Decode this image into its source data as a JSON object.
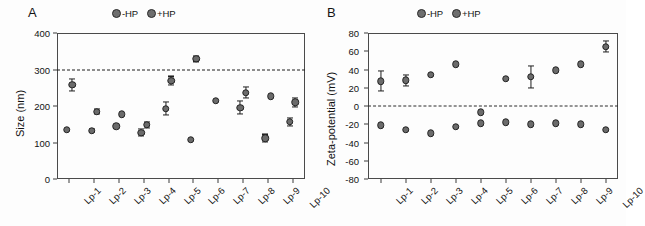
{
  "figure": {
    "background": "#fdfdfd",
    "marker_fill": "#6b6b6b",
    "marker_edge": "#232323"
  },
  "panels": [
    {
      "letter": "A",
      "legend": [
        {
          "label": "-HP",
          "marker": "filled-circle-marker"
        },
        {
          "label": "+HP",
          "marker": "filled-circle-marker"
        }
      ]
    },
    {
      "letter": "B",
      "legend": [
        {
          "label": "-HP",
          "marker": "filled-circle-marker"
        },
        {
          "label": "+HP",
          "marker": "filled-circle-marker"
        }
      ]
    }
  ],
  "chart_data": [
    {
      "type": "scatter",
      "panel": "A",
      "title": "",
      "xlabel": "",
      "ylabel": "Size (nm)",
      "ylim": [
        0,
        400
      ],
      "yticks": [
        0,
        100,
        200,
        300,
        400
      ],
      "ytick_labels": [
        "0",
        "100",
        "200",
        "300",
        "400"
      ],
      "grid": false,
      "legend_position": "top-center",
      "categories": [
        "Lp-1",
        "Lp-2",
        "Lp-3",
        "Lp-4",
        "Lp-5",
        "Lp-6",
        "Lp-7",
        "Lp-8",
        "Lp-9",
        "Lp-10"
      ],
      "reference_line": {
        "value": 300,
        "style": "dash-dot",
        "label": ""
      },
      "series": [
        {
          "name": "-HP",
          "values": [
            135,
            132,
            145,
            127,
            193,
            108,
            215,
            195,
            112,
            157
          ],
          "errors": [
            0,
            4,
            0,
            9,
            18,
            0,
            0,
            18,
            10,
            11
          ]
        },
        {
          "name": "+HP",
          "values": [
            258,
            184,
            177,
            149,
            269,
            330,
            null,
            236,
            227,
            210
          ],
          "errors": [
            16,
            7,
            0,
            8,
            12,
            8,
            null,
            15,
            0,
            13
          ]
        }
      ]
    },
    {
      "type": "scatter",
      "panel": "B",
      "title": "",
      "xlabel": "",
      "ylabel": "Zeta-potential (mV)",
      "ylim": [
        -80,
        80
      ],
      "yticks": [
        -80,
        -60,
        -40,
        -20,
        0,
        20,
        40,
        60,
        80
      ],
      "ytick_labels": [
        "-80",
        "-60",
        "-40",
        "-20",
        "0",
        "20",
        "40",
        "60",
        "80"
      ],
      "grid": false,
      "legend_position": "top-center",
      "categories": [
        "Lp-1",
        "Lp-2",
        "Lp-3",
        "Lp-4",
        "Lp-5",
        "Lp-6",
        "Lp-7",
        "Lp-8",
        "Lp-9",
        "Lp-10"
      ],
      "reference_line": {
        "value": 0,
        "style": "dashed",
        "label": ""
      },
      "series": [
        {
          "name": "-HP",
          "values": [
            -21,
            -26,
            -30,
            -23,
            -19,
            -18,
            -20,
            -19,
            -20,
            -26
          ],
          "errors": [
            0,
            0,
            0,
            0,
            0,
            0,
            0,
            0,
            0,
            0
          ]
        },
        {
          "name": "+HP",
          "values": [
            27,
            28,
            34,
            46,
            -7,
            30,
            32,
            39,
            46,
            65
          ],
          "errors": [
            11,
            6,
            0,
            0,
            0,
            0,
            12,
            0,
            0,
            6
          ]
        }
      ]
    }
  ]
}
